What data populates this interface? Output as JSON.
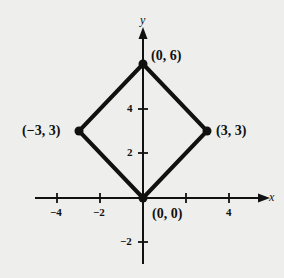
{
  "diagram": {
    "type": "coordinate-plane-polygon",
    "shape": "square (rotated 45°)",
    "axes": {
      "x_label": "x",
      "y_label": "y",
      "x_ticks": [
        "−4",
        "−2",
        "4"
      ],
      "y_ticks": [
        "4",
        "2",
        "−2"
      ]
    },
    "vertices": [
      {
        "label": "(0, 6)",
        "x": 0,
        "y": 6
      },
      {
        "label": "(3, 3)",
        "x": 3,
        "y": 3
      },
      {
        "label": "(0, 0)",
        "x": 0,
        "y": 0
      },
      {
        "label": "(−3, 3)",
        "x": -3,
        "y": 3
      }
    ],
    "colors": {
      "background": "#eeeeec",
      "ink": "#111111"
    }
  }
}
